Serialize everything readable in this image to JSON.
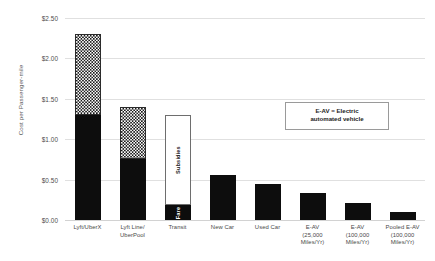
{
  "chart_data": {
    "type": "bar",
    "subtype": "stacked-bar",
    "title": "",
    "xlabel": "",
    "ylabel": "Cost per Passenger-mile",
    "ylim": [
      0,
      2.5
    ],
    "ytick_labels": [
      "$2.50",
      "$2.00",
      "$1.50",
      "$1.00",
      "$0.50",
      "$0.00"
    ],
    "ytick_values": [
      2.5,
      2.0,
      1.5,
      1.0,
      0.5,
      0.0
    ],
    "grid": true,
    "legend": "none",
    "currency": "USD",
    "categories": [
      "Lyft/UberX",
      "Lyft Line/UberPool",
      "Transit",
      "New Car",
      "Used Car",
      "E-AV (25,000 Miles/Yr)",
      "E-AV (100,000 Miles/Yr)",
      "Pooled E-AV (100,000 Miles/Yr)"
    ],
    "category_lines": [
      [
        "Lyft/UberX"
      ],
      [
        "Lyft Line/",
        "UberPool"
      ],
      [
        "Transit"
      ],
      [
        "New Car"
      ],
      [
        "Used Car"
      ],
      [
        "E-AV",
        "(25,000",
        "Miles/Yr)"
      ],
      [
        "E-AV",
        "(100,000",
        "Miles/Yr)"
      ],
      [
        "Pooled E-AV",
        "(100,000",
        "Miles/Yr)"
      ]
    ],
    "series": [
      {
        "name": "Base cost",
        "style": "solid-black",
        "values": [
          1.3,
          0.76,
          0.18,
          0.56,
          0.45,
          0.33,
          0.21,
          0.1
        ]
      },
      {
        "name": "Additional cost",
        "style": "checkered",
        "values": [
          1.0,
          0.64,
          0.0,
          0.0,
          0.0,
          0.0,
          0.0,
          0.0
        ]
      },
      {
        "name": "Subsidies",
        "style": "open-white",
        "values": [
          0.0,
          0.0,
          1.12,
          0.0,
          0.0,
          0.0,
          0.0,
          0.0
        ]
      }
    ],
    "totals": [
      2.3,
      1.4,
      1.3,
      0.56,
      0.45,
      0.33,
      0.21,
      0.1
    ],
    "bar_labels": {
      "transit_bottom": "Fare",
      "transit_top": "Subsidies"
    },
    "annotation": {
      "line1": "E-AV = Electric",
      "line2": "automated vehicle"
    },
    "colors": {
      "solid": "#0d0d0d",
      "hatch_fg": "#1a1a1a",
      "hatch_bg": "#ffffff",
      "open_border": "#6e6e6e",
      "gridline": "#e0e0e0",
      "text": "#4a4a4a",
      "background": "#ffffff"
    }
  }
}
